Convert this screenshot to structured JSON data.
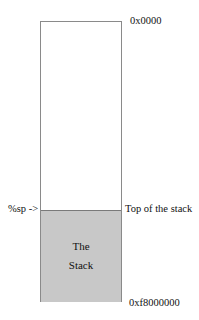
{
  "diagram": {
    "addresses": {
      "low": "0x0000",
      "high": "0xf8000000"
    },
    "pointer": {
      "label": "%sp ->",
      "target_label": "Top of the stack"
    },
    "stack": {
      "line1": "The",
      "line2": "Stack",
      "fill_color": "#c8c8c8"
    }
  }
}
